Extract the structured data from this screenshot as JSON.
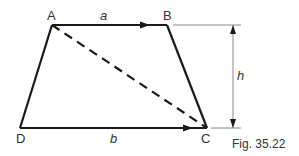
{
  "figure": {
    "caption": "Fig. 35.22",
    "shape": "trapezium",
    "vertices": {
      "A": {
        "label": "A",
        "x": 52,
        "y": 25
      },
      "B": {
        "label": "B",
        "x": 167,
        "y": 25
      },
      "C": {
        "label": "C",
        "x": 207,
        "y": 128
      },
      "D": {
        "label": "D",
        "x": 20,
        "y": 128
      }
    },
    "sides": {
      "top": {
        "from": "A",
        "to": "B",
        "label": "a",
        "arrow": true
      },
      "bottom": {
        "from": "D",
        "to": "C",
        "label": "b",
        "arrow": true
      },
      "left": {
        "from": "D",
        "to": "A"
      },
      "right": {
        "from": "B",
        "to": "C"
      }
    },
    "diagonal": {
      "from": "A",
      "to": "C",
      "style": "dashed"
    },
    "height": {
      "label": "h",
      "x": 233,
      "from_y": 25,
      "to_y": 128
    },
    "colors": {
      "line": "#1a1a1a",
      "dimension": "#888888",
      "text": "#333333"
    }
  }
}
